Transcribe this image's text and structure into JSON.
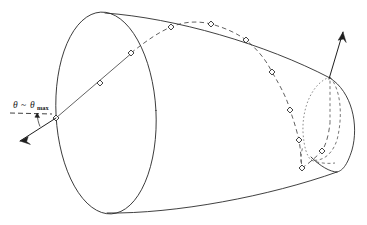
{
  "figure": {
    "background_color": "#ffffff",
    "line_color": "#2b2b2b",
    "width": 367,
    "height": 225,
    "annotation": {
      "name": "theta-max-label",
      "theta_symbol": "θ",
      "relation_symbol": "~",
      "theta_symbol_2": "θ",
      "subscript": "max",
      "full_text": "θ ~ θmax"
    },
    "elements": {
      "left_ellipse_label": "left-base-ellipse",
      "right_cap_label": "right-end-cap",
      "inner_loop_label": "inner-dotted-loop",
      "top_generator_label": "top-generator-line",
      "bottom_generator_label": "bottom-generator-line",
      "straight_trajectory_label": "straight-trajectory-segment",
      "dashed_trajectory_label": "dashed-helical-trajectory",
      "entry_arrow_label": "entry-direction-arrow",
      "exit_arrow_label": "exit-direction-arrow",
      "reference_axis_label": "horizontal-reference-dash",
      "angle_arc_label": "theta-angle-arc"
    },
    "marker_points": {
      "count": 12,
      "radius": 2.1,
      "coordinates": [
        [
          56,
          118
        ],
        [
          100,
          83
        ],
        [
          131,
          53
        ],
        [
          171,
          27
        ],
        [
          211,
          24
        ],
        [
          246,
          40
        ],
        [
          272,
          72
        ],
        [
          290,
          110
        ],
        [
          299,
          140
        ],
        [
          302,
          168
        ],
        [
          322,
          151
        ],
        [
          330,
          123
        ]
      ]
    }
  }
}
